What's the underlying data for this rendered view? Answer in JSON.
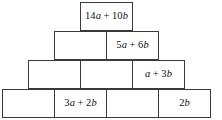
{
  "diagram": {
    "type": "algebra-pyramid",
    "rows": [
      {
        "row_index": 1,
        "cells": [
          {
            "text": "14a + 10b",
            "filled": true,
            "tokens": [
              {
                "t": "14",
                "k": "num"
              },
              {
                "t": "a",
                "k": "var"
              },
              {
                "t": "+",
                "k": "op"
              },
              {
                "t": "10",
                "k": "num"
              },
              {
                "t": "b",
                "k": "var"
              }
            ]
          }
        ]
      },
      {
        "row_index": 2,
        "cells": [
          {
            "text": "",
            "filled": false,
            "tokens": []
          },
          {
            "text": "5a + 6b",
            "filled": true,
            "tokens": [
              {
                "t": "5",
                "k": "num"
              },
              {
                "t": "a",
                "k": "var"
              },
              {
                "t": "+",
                "k": "op"
              },
              {
                "t": "6",
                "k": "num"
              },
              {
                "t": "b",
                "k": "var"
              }
            ]
          }
        ]
      },
      {
        "row_index": 3,
        "cells": [
          {
            "text": "",
            "filled": false,
            "tokens": []
          },
          {
            "text": "",
            "filled": false,
            "tokens": []
          },
          {
            "text": "a + 3b",
            "filled": true,
            "tokens": [
              {
                "t": "a",
                "k": "var"
              },
              {
                "t": "+",
                "k": "op"
              },
              {
                "t": "3",
                "k": "num"
              },
              {
                "t": "b",
                "k": "var"
              }
            ]
          }
        ]
      },
      {
        "row_index": 4,
        "cells": [
          {
            "text": "",
            "filled": false,
            "tokens": []
          },
          {
            "text": "3a + 2b",
            "filled": true,
            "tokens": [
              {
                "t": "3",
                "k": "num"
              },
              {
                "t": "a",
                "k": "var"
              },
              {
                "t": "+",
                "k": "op"
              },
              {
                "t": "2",
                "k": "num"
              },
              {
                "t": "b",
                "k": "var"
              }
            ]
          },
          {
            "text": "",
            "filled": false,
            "tokens": []
          },
          {
            "text": "2b",
            "filled": true,
            "tokens": [
              {
                "t": "2",
                "k": "num"
              },
              {
                "t": "b",
                "k": "var"
              }
            ]
          }
        ]
      }
    ],
    "colors": {
      "border": "#3a3a3a",
      "cell_fill": "#ffffff",
      "text": "#111111",
      "background": "#ffffff"
    }
  }
}
